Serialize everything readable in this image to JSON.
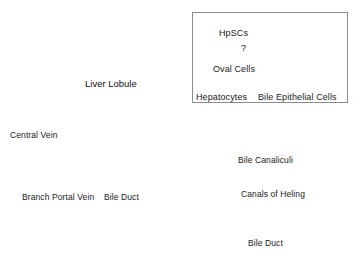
{
  "figure": {
    "lobule_title": "Liver Lobule",
    "labels": {
      "central_vein": "Central Vein",
      "branch_portal_vein": "Branch Portal Vein",
      "bile_duct_lobule": "Bile Duct",
      "bile_canaliculi": "Bile Canaliculi",
      "canals_of_hering": "Canals of Heling",
      "bile_duct_bottom": "Bile Duct"
    },
    "inset": {
      "nodes": {
        "hpscs": "HpSCs",
        "question": "?",
        "oval_cells": "Oval Cells",
        "hepatocytes": "Hepatocytes",
        "bile_epithelial_cells": "Bile Epithelial Cells"
      }
    },
    "colors": {
      "stroke": "#000000",
      "fill_dark": "#000000",
      "fill_light": "#ffffff",
      "box_border": "#808080",
      "text": "#1a1a1a"
    },
    "structure": {
      "hexagon_vertices": 6,
      "portal_triad_marker_dark": "portal vein (filled dot)",
      "portal_triad_marker_light": "bile duct (open dot)",
      "duct_cell_rows": 14
    }
  }
}
